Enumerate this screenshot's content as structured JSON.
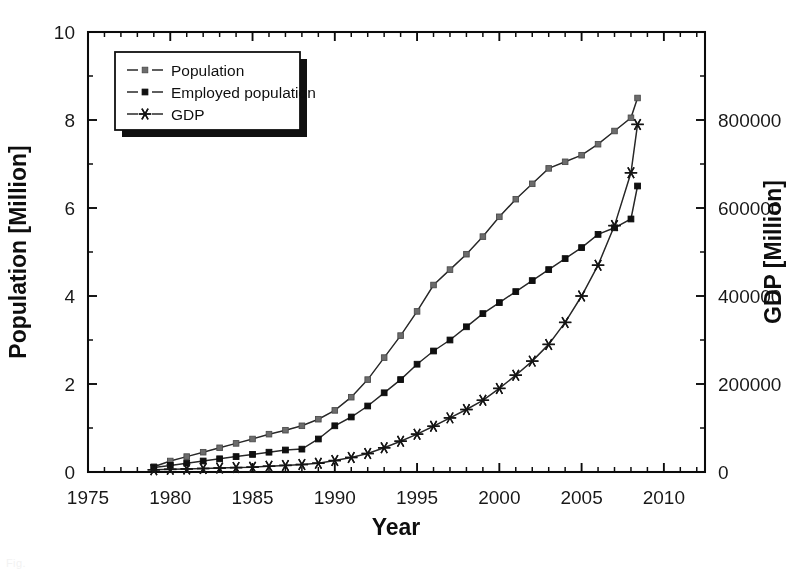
{
  "figure": {
    "background": "#fefefe",
    "ink_color": "#1a1a1a",
    "faint_caption": "Fig."
  },
  "chart_data": {
    "type": "line",
    "title": "",
    "subtitle": "",
    "xlabel": "Year",
    "ylabel": "Population [Million]",
    "y2label": "GDP [Million]",
    "xlim": [
      1975,
      2012.5
    ],
    "ylim": [
      0,
      10
    ],
    "y2lim": [
      0,
      1000000
    ],
    "grid": false,
    "legend_position": "upper left (inside plot)",
    "xticks": [
      1975,
      1980,
      1985,
      1990,
      1995,
      2000,
      2005,
      2010
    ],
    "xtick_labels": [
      "1975",
      "1980",
      "1985",
      "1990",
      "1995",
      "2000",
      "2005",
      "2010"
    ],
    "xminor_step": 1,
    "yticks": [
      0,
      2,
      4,
      6,
      8,
      10
    ],
    "ytick_labels": [
      "0",
      "2",
      "4",
      "6",
      "8",
      "10"
    ],
    "yminor_step": 1,
    "y2ticks": [
      0,
      200000,
      400000,
      600000,
      800000
    ],
    "y2tick_labels": [
      "0",
      "200000",
      "400000",
      "600000",
      "800000"
    ],
    "x": [
      1979,
      1980,
      1981,
      1982,
      1983,
      1984,
      1985,
      1986,
      1987,
      1988,
      1989,
      1990,
      1991,
      1992,
      1993,
      1994,
      1995,
      1996,
      1997,
      1998,
      1999,
      2000,
      2001,
      2002,
      2003,
      2004,
      2005,
      2006,
      2007,
      2008
    ],
    "series": [
      {
        "name": "Population",
        "axis": "left",
        "marker": "square-grey",
        "marker_color": "#6d6d6d",
        "line_color": "#3a3a3a",
        "units": "Million",
        "values": [
          0.12,
          0.25,
          0.35,
          0.45,
          0.55,
          0.65,
          0.75,
          0.86,
          0.95,
          1.05,
          1.2,
          1.4,
          1.7,
          2.1,
          2.6,
          3.1,
          3.65,
          4.25,
          4.6,
          4.95,
          5.35,
          5.8,
          6.2,
          6.55,
          6.9,
          7.05,
          7.2,
          7.45,
          7.75,
          8.05
        ]
      },
      {
        "name": "Employed population",
        "axis": "left",
        "marker": "square-black",
        "marker_color": "#151515",
        "line_color": "#2b2b2b",
        "units": "Million",
        "values": [
          0.1,
          0.15,
          0.2,
          0.25,
          0.3,
          0.35,
          0.4,
          0.45,
          0.5,
          0.52,
          0.75,
          1.05,
          1.25,
          1.5,
          1.8,
          2.1,
          2.45,
          2.75,
          3.0,
          3.3,
          3.6,
          3.85,
          4.1,
          4.35,
          4.6,
          4.85,
          5.1,
          5.4,
          5.55,
          5.75
        ]
      },
      {
        "name": "GDP",
        "axis": "right",
        "marker": "asterisk",
        "marker_color": "#1a1a1a",
        "line_color": "#2b2b2b",
        "units": "Million",
        "values": [
          5000,
          6000,
          7000,
          8000,
          9000,
          10000,
          11000,
          13000,
          15000,
          17000,
          20000,
          26000,
          33000,
          42000,
          55000,
          70000,
          86000,
          104000,
          123000,
          142000,
          163000,
          190000,
          220000,
          252000,
          290000,
          340000,
          400000,
          470000,
          560000,
          680000
        ]
      }
    ],
    "series_tail": [
      {
        "name": "Population",
        "x": [
          2008.4
        ],
        "values": [
          8.5
        ]
      },
      {
        "name": "Employed population",
        "x": [
          2008.4
        ],
        "values": [
          6.5
        ]
      },
      {
        "name": "GDP",
        "x": [
          2008.4
        ],
        "values": [
          790000
        ]
      }
    ]
  },
  "legend": {
    "items": [
      {
        "label": "Population",
        "marker": "square-grey"
      },
      {
        "label": "Employed population",
        "marker": "square-black"
      },
      {
        "label": "GDP",
        "marker": "asterisk"
      }
    ]
  }
}
